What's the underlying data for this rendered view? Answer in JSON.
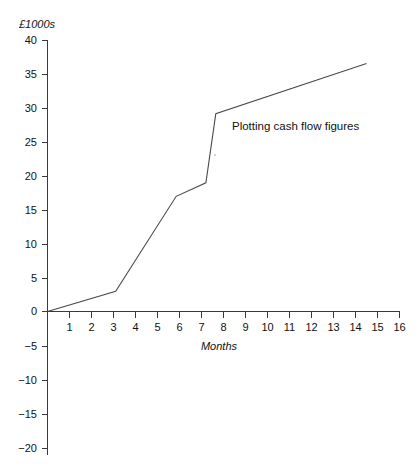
{
  "chart_data": {
    "type": "line",
    "title": "",
    "annotation": "Plotting cash flow figures",
    "xlabel": "Months",
    "ylabel": "£1000s",
    "xlim": [
      0,
      16
    ],
    "ylim": [
      -20,
      40
    ],
    "grid": false,
    "legend": "none",
    "x_ticks": [
      1,
      2,
      3,
      4,
      5,
      6,
      7,
      8,
      9,
      10,
      11,
      12,
      13,
      14,
      15,
      16
    ],
    "x_tick_labels": [
      "1",
      "2",
      "3",
      "4",
      "5",
      "6",
      "7",
      "8",
      "9",
      "10",
      "11",
      "12",
      "13",
      "14",
      "15",
      "16"
    ],
    "y_ticks": [
      40,
      35,
      30,
      25,
      20,
      15,
      10,
      5,
      0,
      -5,
      -10,
      -15,
      -20
    ],
    "y_tick_labels": [
      "40",
      "35",
      "30",
      "25",
      "20",
      "15",
      "10",
      "5",
      "0",
      "−5",
      "−10",
      "−15",
      "−20"
    ],
    "series": [
      {
        "name": "Cumulative cash flow",
        "color": "#4a4a4a",
        "points": [
          {
            "x": 0.0,
            "y": 0.0
          },
          {
            "x": 3.1,
            "y": 3.0
          },
          {
            "x": 5.85,
            "y": 17.0
          },
          {
            "x": 7.2,
            "y": 19.0
          },
          {
            "x": 7.65,
            "y": 29.2
          },
          {
            "x": 14.5,
            "y": 36.6
          }
        ]
      }
    ]
  },
  "labels": {
    "y_axis_title": "£1000s",
    "x_axis_title": "Months",
    "annotation": "Plotting cash flow figures"
  }
}
